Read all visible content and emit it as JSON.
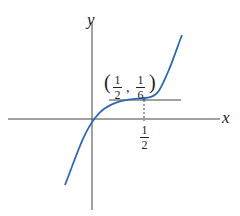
{
  "diagram": {
    "axis_labels": {
      "x": "x",
      "y": "y"
    },
    "point_label": {
      "open": "(",
      "x_num": "1",
      "x_den": "2",
      "comma": ",",
      "y_num": "1",
      "y_den": "6",
      "close": ")"
    },
    "x_tick": {
      "num": "1",
      "den": "2"
    },
    "curve_color": "#2e6bb0"
  }
}
